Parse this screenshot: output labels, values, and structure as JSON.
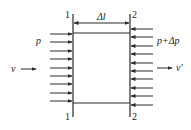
{
  "diagram": {
    "colors": {
      "stroke": "#2a2a2a",
      "background": "#ffffff"
    },
    "sections": [
      {
        "id": "section-1",
        "x": 73,
        "label_top": "1",
        "label_bottom": "1"
      },
      {
        "id": "section-2",
        "x": 130,
        "label_top": "2",
        "label_bottom": "2"
      }
    ],
    "box": {
      "top": 33,
      "bottom": 103
    },
    "length_label": "Δl",
    "left_pressure_label": "p",
    "right_pressure_label": "p+Δp",
    "inlet_velocity_label": "v",
    "outlet_velocity_label": "v′",
    "left_arrows_y": [
      34,
      42,
      51,
      59,
      68,
      76,
      84,
      93,
      101
    ],
    "right_arrows_y": [
      29,
      37,
      46,
      54,
      63,
      71,
      79,
      88,
      96,
      105
    ]
  }
}
